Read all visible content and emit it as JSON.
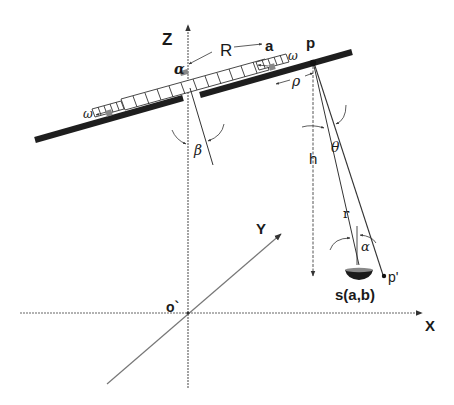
{
  "diagram": {
    "type": "heliostat-geometry",
    "axes": {
      "z_label": "Z",
      "x_label": "X",
      "y_label": "Y",
      "origin_label": "o`"
    },
    "points": {
      "p": "p",
      "p_prime": "p'",
      "a": "a",
      "s": "s(a,b)",
      "center_symbol": "α"
    },
    "distances": {
      "R": "R",
      "h": "h",
      "r": "r",
      "rho": "ρ"
    },
    "angles": {
      "beta": "β",
      "theta": "θ",
      "alpha": "α",
      "omega": "ω"
    },
    "colors": {
      "line": "#555555",
      "bar": "#1e1e1e",
      "text": "#1a1a1a"
    }
  }
}
